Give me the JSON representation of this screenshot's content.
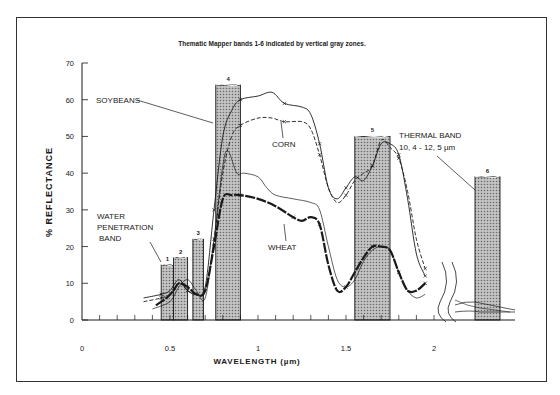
{
  "chart_data": {
    "type": "line",
    "title": "Thematic Mapper bands 1-6 indicated by vertical gray zones.",
    "xlabel": "WAVELENGTH (µm)",
    "ylabel": "% REFLECTANCE",
    "xlim": [
      0,
      2.0
    ],
    "ylim": [
      0,
      70
    ],
    "x_ticks": [
      "0",
      "0.5",
      "1",
      "1.5",
      "2"
    ],
    "y_ticks": [
      "0",
      "10",
      "20",
      "30",
      "40",
      "50",
      "60",
      "70"
    ],
    "grid": false,
    "bands": [
      {
        "id": "1",
        "x0": 0.45,
        "x1": 0.52,
        "height": 15
      },
      {
        "id": "2",
        "x0": 0.52,
        "x1": 0.6,
        "height": 17
      },
      {
        "id": "3",
        "x0": 0.63,
        "x1": 0.69,
        "height": 22
      },
      {
        "id": "4",
        "x0": 0.76,
        "x1": 0.9,
        "height": 64
      },
      {
        "id": "5",
        "x0": 1.55,
        "x1": 1.75,
        "height": 50
      },
      {
        "id": "6",
        "x0": 2.25,
        "x1": 2.39,
        "height": 39,
        "note": "beyond axis break"
      }
    ],
    "series": [
      {
        "name": "SOYBEANS",
        "style": "solid-x",
        "x": [
          0.35,
          0.45,
          0.5,
          0.55,
          0.6,
          0.65,
          0.7,
          0.75,
          0.8,
          0.85,
          0.9,
          1.0,
          1.08,
          1.15,
          1.25,
          1.3,
          1.35,
          1.4,
          1.45,
          1.5,
          1.55,
          1.6,
          1.65,
          1.7,
          1.75,
          1.8,
          1.85,
          1.9,
          1.95
        ],
        "y": [
          6,
          7,
          8,
          11,
          8,
          7,
          9,
          30,
          50,
          57,
          60,
          61,
          62,
          59,
          58,
          56,
          48,
          36,
          33,
          36,
          39,
          38,
          42,
          48,
          48,
          45,
          33,
          18,
          12
        ]
      },
      {
        "name": "CORN",
        "style": "dashed-x",
        "x": [
          0.35,
          0.45,
          0.5,
          0.55,
          0.6,
          0.65,
          0.7,
          0.75,
          0.8,
          0.85,
          0.9,
          1.0,
          1.08,
          1.15,
          1.25,
          1.3,
          1.35,
          1.4,
          1.45,
          1.5,
          1.55,
          1.6,
          1.65,
          1.7,
          1.75,
          1.8,
          1.85,
          1.9,
          1.95
        ],
        "y": [
          5,
          6,
          7,
          10,
          8,
          7,
          8,
          22,
          40,
          50,
          53,
          55,
          55,
          54,
          54,
          52,
          45,
          36,
          32,
          34,
          38,
          40,
          42,
          49,
          47,
          44,
          35,
          22,
          14
        ]
      },
      {
        "name": "WHEAT",
        "style": "bold-x",
        "x": [
          0.42,
          0.48,
          0.52,
          0.55,
          0.6,
          0.65,
          0.7,
          0.75,
          0.8,
          0.85,
          0.9,
          1.0,
          1.1,
          1.2,
          1.25,
          1.3,
          1.35,
          1.4,
          1.45,
          1.5,
          1.55,
          1.6,
          1.65,
          1.7,
          1.75,
          1.8,
          1.85,
          1.9,
          1.95
        ],
        "y": [
          4,
          6,
          8,
          10,
          9,
          7,
          8,
          20,
          33,
          34,
          34,
          33,
          31,
          28,
          27,
          28,
          26,
          15,
          8,
          9,
          13,
          17,
          20,
          20,
          19,
          13,
          8,
          8,
          10
        ]
      },
      {
        "name": "unlabeled-thin",
        "style": "thin",
        "x": [
          0.4,
          0.5,
          0.55,
          0.6,
          0.65,
          0.7,
          0.75,
          0.8,
          0.83,
          0.88,
          0.92,
          1.0,
          1.05,
          1.1,
          1.2,
          1.3,
          1.35,
          1.4,
          1.45,
          1.5,
          1.55,
          1.6,
          1.65,
          1.7,
          1.75,
          1.8,
          1.85,
          1.9,
          1.95
        ],
        "y": [
          3,
          5,
          9,
          11,
          8,
          6,
          22,
          42,
          46,
          40,
          40,
          39,
          36,
          34,
          33,
          32,
          30,
          20,
          11,
          9,
          11,
          16,
          19,
          20,
          19,
          13,
          8,
          6,
          7
        ]
      }
    ],
    "annotations": [
      {
        "text": "SOYBEANS",
        "points_to": "soybeans at 0.76 µm"
      },
      {
        "text": "CORN",
        "points_to": "corn near 1.0 µm"
      },
      {
        "text": "WHEAT",
        "points_to": "wheat near 1.1 µm"
      },
      {
        "text": "WATER PENETRATION BAND",
        "points_to": "band 1"
      },
      {
        "text": "THERMAL BAND 10.4 - 12.5 µm",
        "points_to": "band 6"
      }
    ]
  },
  "labels": {
    "title": "Thematic Mapper bands 1-6 indicated by vertical gray zones.",
    "ylabel": "% REFLECTANCE",
    "xlabel": "WAVELENGTH (µm)",
    "soybeans": "SOYBEANS",
    "corn": "CORN",
    "wheat": "WHEAT",
    "water1": "WATER",
    "water2": "PENETRATION",
    "water3": "BAND",
    "thermal1": "THERMAL BAND",
    "thermal2": "10, 4  -  12, 5  µm"
  },
  "colors": {
    "band_fill": "#9a9a9a",
    "ink": "#1a1a1a",
    "frame": "#333333"
  }
}
